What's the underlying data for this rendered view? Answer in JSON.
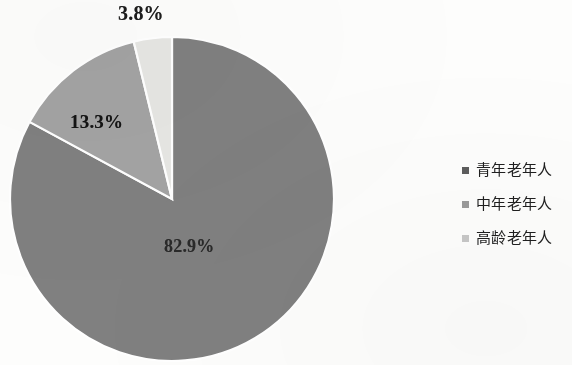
{
  "figure": {
    "background_color": "#fdfdfc",
    "width": 572,
    "height": 365
  },
  "chart_data": {
    "type": "pie",
    "title": "",
    "subtitle": "",
    "xlabel": "",
    "ylabel": "",
    "legend_position": "right",
    "grid": false,
    "start_angle_deg": 0,
    "direction": "clockwise",
    "categories": [
      "青年老年人",
      "中年老年人",
      "高龄老年人"
    ],
    "values": [
      82.9,
      13.3,
      3.8
    ],
    "value_labels": [
      "82.9%",
      "13.3%",
      "3.8%"
    ],
    "colors": [
      "#808080",
      "#a3a3a3",
      "#e6e6e3"
    ],
    "slices": [
      {
        "name": "青年老年人",
        "value": 82.9,
        "label": "82.9%",
        "color": "#808080",
        "legend_swatch_color": "#5d5d5d"
      },
      {
        "name": "中年老年人",
        "value": 13.3,
        "label": "13.3%",
        "color": "#a3a3a3",
        "legend_swatch_color": "#9a9a9a"
      },
      {
        "name": "高龄老年人",
        "value": 3.8,
        "label": "3.8%",
        "color": "#e6e6e3",
        "legend_swatch_color": "#c7c7c7"
      }
    ]
  },
  "labels": {
    "high_age": "3.8%",
    "mid_age": "13.3%",
    "young_age": "82.9%"
  },
  "legend": {
    "items": [
      {
        "label": "青年老年人",
        "color": "#5d5d5d"
      },
      {
        "label": "中年老年人",
        "color": "#9a9a9a"
      },
      {
        "label": "高龄老年人",
        "color": "#c7c7c7"
      }
    ]
  }
}
